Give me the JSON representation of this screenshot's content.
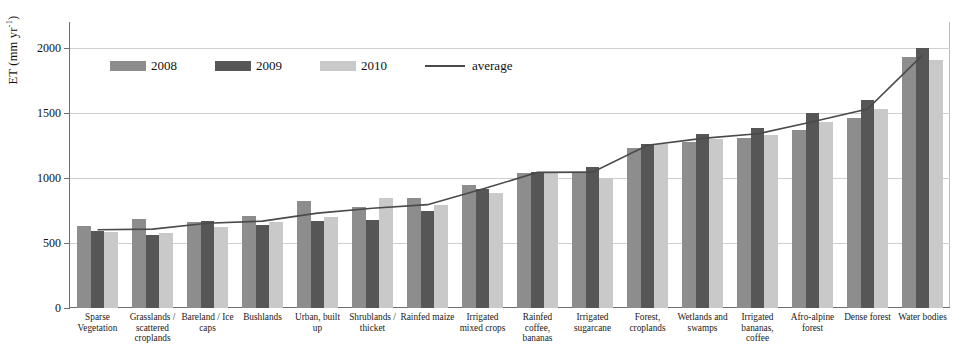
{
  "chart_data": {
    "type": "bar",
    "title": "",
    "xlabel": "",
    "ylabel": "ET (mm yr-1)",
    "ylabel_base": "ET (mm yr",
    "ylabel_exp": "-1",
    "ylabel_tail": ")",
    "ylim": [
      0,
      2200
    ],
    "yticks": [
      0,
      500,
      1000,
      1500,
      2000
    ],
    "ytick_labels": [
      "0",
      "500",
      "1000",
      "1500",
      "2000"
    ],
    "grid": true,
    "legend_position": "upper-left-inside",
    "categories": [
      "Sparse Vegetation",
      "Grasslands / scattered croplands",
      "Bareland / Ice caps",
      "Bushlands",
      "Urban, built up",
      "Shrublands / thicket",
      "Rainfed maize",
      "Irrigated mixed crops",
      "Rainfed coffee, bananas",
      "Irrigated sugarcane",
      "Forest, croplands",
      "Wetlands and swamps",
      "Irrigated bananas, coffee",
      "Afro-alpine forest",
      "Dense forest",
      "Water bodies"
    ],
    "series": [
      {
        "name": "2008",
        "color": "#8d8d8d",
        "values": [
          630,
          685,
          665,
          705,
          820,
          775,
          850,
          945,
          1035,
          1050,
          1230,
          1280,
          1305,
          1370,
          1460,
          1930
        ]
      },
      {
        "name": "2009",
        "color": "#565656",
        "values": [
          590,
          560,
          670,
          640,
          670,
          680,
          745,
          915,
          1045,
          1085,
          1265,
          1335,
          1385,
          1500,
          1600,
          2000
        ]
      },
      {
        "name": "2010",
        "color": "#c9c9c9",
        "values": [
          585,
          575,
          620,
          660,
          700,
          845,
          790,
          885,
          1050,
          1000,
          1260,
          1300,
          1330,
          1430,
          1530,
          1905
        ]
      }
    ],
    "average": {
      "name": "average",
      "color": "#4a4a4a",
      "values": [
        602,
        607,
        652,
        668,
        730,
        767,
        795,
        915,
        1043,
        1045,
        1252,
        1305,
        1340,
        1433,
        1530,
        1945
      ]
    }
  },
  "legend": {
    "items": [
      {
        "label": "2008",
        "type": "swatch",
        "key": "y2008"
      },
      {
        "label": "2009",
        "type": "swatch",
        "key": "y2009"
      },
      {
        "label": "2010",
        "type": "swatch",
        "key": "y2010"
      },
      {
        "label": "average",
        "type": "line",
        "key": "avg"
      }
    ]
  }
}
